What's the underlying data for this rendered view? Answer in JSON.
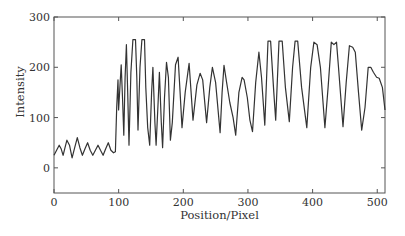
{
  "chart_data": {
    "type": "line",
    "title": "",
    "xlabel": "Position/Pixel",
    "ylabel": "Intensity",
    "xlim": [
      0,
      512
    ],
    "ylim": [
      -50,
      300
    ],
    "xticks": [
      0,
      100,
      200,
      300,
      400,
      500
    ],
    "yticks": [
      0,
      100,
      200,
      300
    ],
    "grid": false,
    "legend": null,
    "line_color": "#333333",
    "series": [
      {
        "name": "Intensity profile",
        "x": [
          0,
          4,
          8,
          11,
          14,
          17,
          20,
          24,
          28,
          32,
          36,
          40,
          44,
          48,
          52,
          56,
          60,
          64,
          68,
          72,
          76,
          80,
          84,
          88,
          92,
          95,
          97,
          99,
          100,
          102,
          104,
          106,
          108,
          110,
          112,
          114,
          116,
          119,
          122,
          126,
          128,
          130,
          133,
          136,
          140,
          142,
          145,
          148,
          151,
          153,
          156,
          158,
          161,
          163,
          166,
          168,
          171,
          174,
          177,
          180,
          183,
          188,
          192,
          195,
          198,
          203,
          209,
          212,
          215,
          221,
          226,
          230,
          236,
          241,
          245,
          250,
          257,
          260,
          263,
          267,
          272,
          277,
          281,
          286,
          291,
          294,
          299,
          303,
          307,
          312,
          317,
          321,
          326,
          331,
          335,
          340,
          343,
          348,
          353,
          358,
          364,
          369,
          373,
          377,
          383,
          391,
          397,
          402,
          407,
          412,
          419,
          424,
          429,
          433,
          437,
          440,
          447,
          452,
          457,
          462,
          466,
          471,
          476,
          481,
          486,
          490,
          494,
          499,
          503,
          508,
          512
        ],
        "y": [
          25,
          35,
          45,
          38,
          25,
          40,
          55,
          45,
          20,
          40,
          60,
          40,
          25,
          38,
          50,
          35,
          25,
          35,
          45,
          35,
          25,
          38,
          50,
          35,
          30,
          32,
          120,
          175,
          115,
          160,
          205,
          140,
          65,
          180,
          245,
          150,
          45,
          190,
          255,
          255,
          180,
          75,
          200,
          255,
          255,
          160,
          80,
          45,
          150,
          200,
          90,
          45,
          130,
          190,
          90,
          40,
          140,
          210,
          180,
          55,
          90,
          205,
          220,
          150,
          80,
          150,
          208,
          150,
          95,
          165,
          188,
          175,
          90,
          160,
          200,
          170,
          70,
          150,
          204,
          170,
          130,
          100,
          65,
          150,
          180,
          175,
          140,
          95,
          72,
          170,
          230,
          180,
          85,
          252,
          252,
          150,
          95,
          252,
          252,
          160,
          92,
          200,
          252,
          252,
          160,
          80,
          200,
          250,
          245,
          200,
          80,
          160,
          250,
          245,
          250,
          200,
          82,
          170,
          243,
          240,
          230,
          150,
          75,
          120,
          200,
          200,
          190,
          180,
          178,
          160,
          115
        ]
      }
    ]
  }
}
